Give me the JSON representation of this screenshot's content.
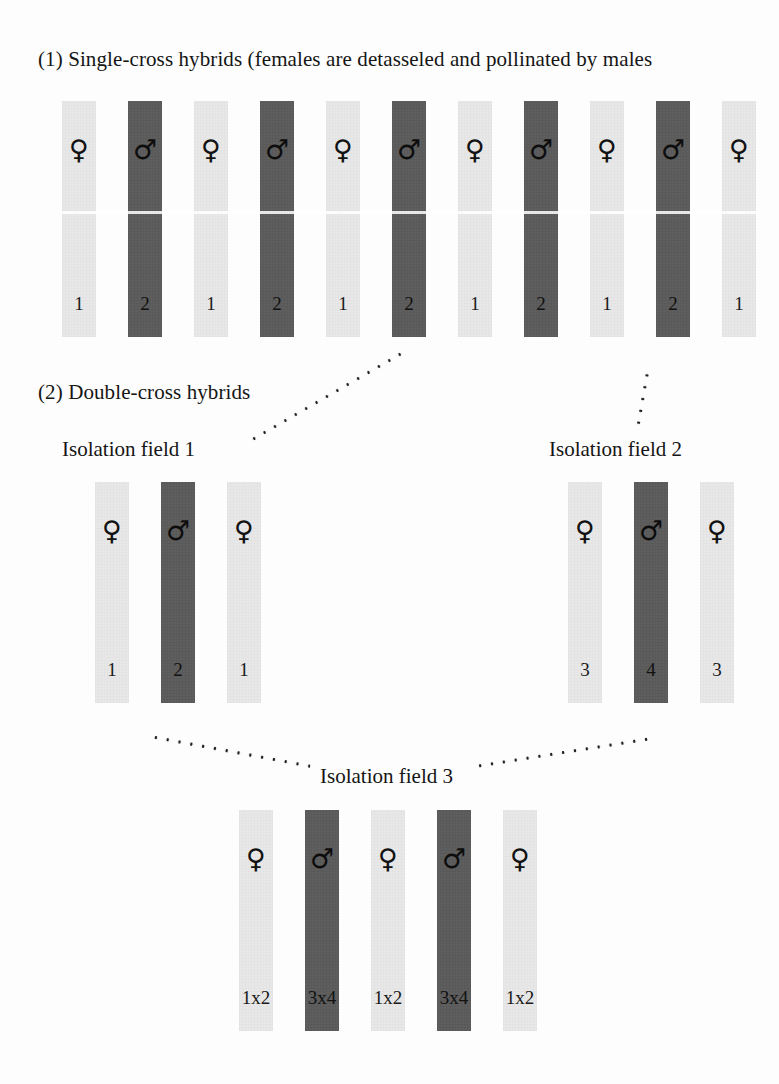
{
  "figure": {
    "sections": [
      {
        "id": "single-cross",
        "caption": "(1) Single-cross hybrids (females are detasseled and pollinated by males"
      },
      {
        "id": "double-cross",
        "caption": "(2) Double-cross hybrids"
      }
    ],
    "field_titles": {
      "field1": "Isolation field 1",
      "field2": "Isolation field 2",
      "field3": "Isolation field 3"
    },
    "symbols": {
      "female": "♀",
      "male": "♂"
    },
    "rows": {
      "single_cross": {
        "name": "single-cross-row",
        "strips": [
          {
            "sex": "female",
            "symbol": "♀",
            "label": "1"
          },
          {
            "sex": "male",
            "symbol": "♂",
            "label": "2"
          },
          {
            "sex": "female",
            "symbol": "♀",
            "label": "1"
          },
          {
            "sex": "male",
            "symbol": "♂",
            "label": "2"
          },
          {
            "sex": "female",
            "symbol": "♀",
            "label": "1"
          },
          {
            "sex": "male",
            "symbol": "♂",
            "label": "2"
          },
          {
            "sex": "female",
            "symbol": "♀",
            "label": "1"
          },
          {
            "sex": "male",
            "symbol": "♂",
            "label": "2"
          },
          {
            "sex": "female",
            "symbol": "♀",
            "label": "1"
          },
          {
            "sex": "male",
            "symbol": "♂",
            "label": "2"
          },
          {
            "sex": "female",
            "symbol": "♀",
            "label": "1"
          }
        ]
      },
      "isolation_field_1": {
        "name": "isolation-field-1",
        "strips": [
          {
            "sex": "female",
            "symbol": "♀",
            "label": "1"
          },
          {
            "sex": "male",
            "symbol": "♂",
            "label": "2"
          },
          {
            "sex": "female",
            "symbol": "♀",
            "label": "1"
          }
        ]
      },
      "isolation_field_2": {
        "name": "isolation-field-2",
        "strips": [
          {
            "sex": "female",
            "symbol": "♀",
            "label": "3"
          },
          {
            "sex": "male",
            "symbol": "♂",
            "label": "4"
          },
          {
            "sex": "female",
            "symbol": "♀",
            "label": "3"
          }
        ]
      },
      "isolation_field_3": {
        "name": "isolation-field-3",
        "strips": [
          {
            "sex": "female",
            "symbol": "♀",
            "label": "1x2"
          },
          {
            "sex": "male",
            "symbol": "♂",
            "label": "3x4"
          },
          {
            "sex": "female",
            "symbol": "♀",
            "label": "1x2"
          },
          {
            "sex": "male",
            "symbol": "♂",
            "label": "3x4"
          },
          {
            "sex": "female",
            "symbol": "♀",
            "label": "1x2"
          }
        ]
      }
    },
    "colors": {
      "female_strip": "#e8e8e8",
      "male_strip": "#5a5a5a",
      "text": "#151515",
      "background": "#fdfdfd"
    }
  }
}
